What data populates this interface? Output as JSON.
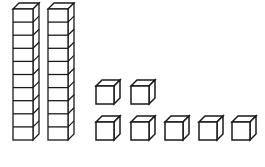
{
  "figure": {
    "background_color": "#ffffff",
    "line_color": "#1a1a1a",
    "face_color": "#ffffff"
  },
  "chart_data": {
    "type": "bar",
    "xlabel": "",
    "ylabel": "",
    "categories": [
      "tens",
      "ones"
    ],
    "values": [
      2,
      7
    ],
    "total": 27,
    "unit_labels": {
      "tens": "tens rods",
      "ones": "unit cubes"
    },
    "grid": false,
    "legend": "none"
  },
  "rods": {
    "count": 2,
    "segments_per_rod": 10,
    "value_each": 10,
    "items": [
      {
        "id": "rod-1",
        "x": 13,
        "y": 9,
        "width": 20,
        "height": 131,
        "depth": 6,
        "segments": 10
      },
      {
        "id": "rod-2",
        "x": 48,
        "y": 9,
        "width": 20,
        "height": 131,
        "depth": 6,
        "segments": 10
      }
    ]
  },
  "cubes": {
    "count": 7,
    "value_each": 1,
    "size": 18,
    "depth": 6,
    "rows": [
      {
        "id": "cube-row-upper",
        "count": 2,
        "y": 86,
        "items": [
          {
            "id": "cube-1",
            "x": 96
          },
          {
            "id": "cube-2",
            "x": 131
          }
        ]
      },
      {
        "id": "cube-row-lower",
        "count": 5,
        "y": 122,
        "items": [
          {
            "id": "cube-3",
            "x": 96
          },
          {
            "id": "cube-4",
            "x": 131
          },
          {
            "id": "cube-5",
            "x": 165
          },
          {
            "id": "cube-6",
            "x": 199
          },
          {
            "id": "cube-7",
            "x": 232
          }
        ]
      }
    ]
  }
}
